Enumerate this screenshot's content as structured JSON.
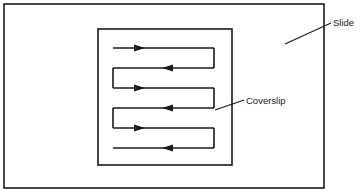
{
  "figure": {
    "background_color": "#ffffff",
    "line_color": "#1a1a1a",
    "slide": {
      "name": "Slide",
      "shape": "rectangle",
      "x": 4,
      "y": 4,
      "width": 320,
      "height": 184,
      "stroke_width": 1.6
    },
    "coverslip": {
      "name": "Coverslip",
      "shape": "rectangle",
      "x": 98,
      "y": 29,
      "width": 134,
      "height": 136,
      "stroke_width": 1.6
    },
    "flow_path": {
      "name": "serpentine-flow-path",
      "description": "Serpentine fluid flow path under the coverslip",
      "stroke_width": 1.6,
      "left_x": 113,
      "right_x": 214,
      "rows": [
        {
          "y": 48,
          "direction": "right",
          "arrow_x": 140
        },
        {
          "y": 68,
          "direction": "left",
          "arrow_x": 167
        },
        {
          "y": 88,
          "direction": "right",
          "arrow_x": 140
        },
        {
          "y": 108,
          "direction": "left",
          "arrow_x": 167
        },
        {
          "y": 128,
          "direction": "right",
          "arrow_x": 140
        },
        {
          "y": 148,
          "direction": "left",
          "arrow_x": 167
        }
      ],
      "turns_right_x": 214,
      "turns_left_x": 113,
      "arrow_size": 7
    }
  },
  "labels": {
    "slide": {
      "text": "Slide",
      "text_x": 333,
      "text_y": 26,
      "leader_from_x": 285,
      "leader_from_y": 44,
      "leader_to_x": 331,
      "leader_to_y": 23
    },
    "coverslip": {
      "text": "Coverslip",
      "text_x": 246,
      "text_y": 105,
      "leader_from_x": 215,
      "leader_from_y": 110,
      "leader_to_x": 244,
      "leader_to_y": 100
    }
  }
}
